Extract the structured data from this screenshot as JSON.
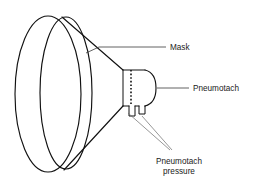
{
  "diagram": {
    "background_color": "#ffffff",
    "line_color": "#111111",
    "text_color": "#1a1a1a",
    "labels": {
      "mask": "Mask",
      "pneumotach": "Pneumotach",
      "pneumotach_pressure_line1": "Pneumotach",
      "pneumotach_pressure_line2": "pressure"
    },
    "parts": [
      {
        "name": "mask-rim",
        "description": "elliptical face-mask rim drawn as two overlapping ellipses"
      },
      {
        "name": "mask-cone",
        "description": "conical mask body tapering from rim to pneumotach"
      },
      {
        "name": "pneumotach-body",
        "description": "short cylinder with rounded right end"
      },
      {
        "name": "pneumotach-mesh",
        "description": "vertical dotted screen inside pneumotach"
      },
      {
        "name": "pressure-port-left",
        "description": "left pressure tap tube on underside"
      },
      {
        "name": "pressure-port-right",
        "description": "right pressure tap tube on underside"
      }
    ]
  }
}
